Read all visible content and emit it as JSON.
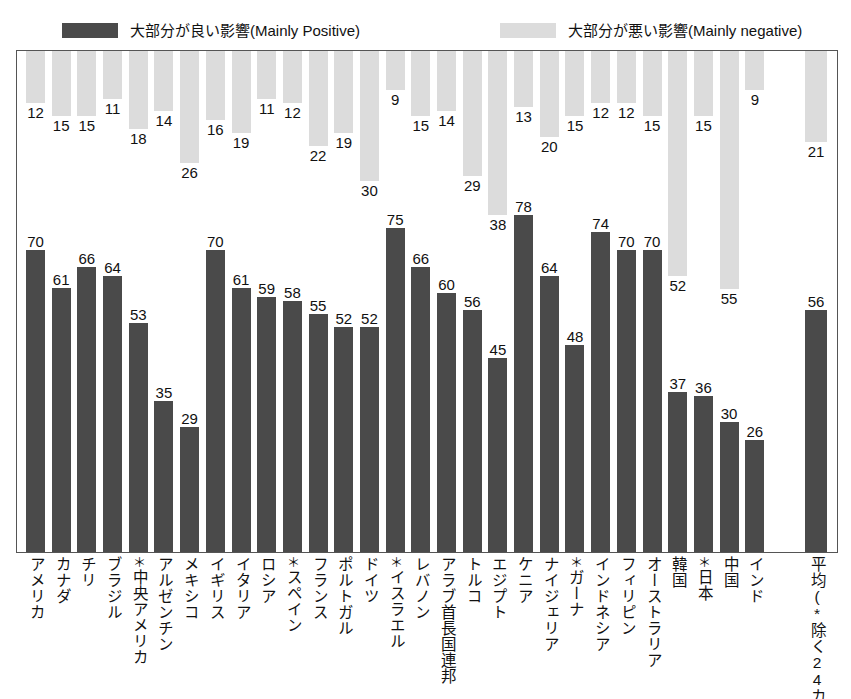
{
  "legend": {
    "positive_label": "大部分が良い影響(Mainly Positive)",
    "negative_label": "大部分が悪い影響(Mainly negative)",
    "positive_color": "#4a4a4a",
    "negative_color": "#dcdcdc"
  },
  "chart_data": {
    "type": "bar",
    "title": "",
    "xlabel": "",
    "ylabel": "",
    "ylim": [
      0,
      100
    ],
    "grid": false,
    "legend_position": "top",
    "orientation": "diverging-vertical",
    "note": "Dark bars rise from baseline (Mainly Positive); light bars hang from top (Mainly negative)",
    "categories": [
      "アメリカ",
      "カナダ",
      "チリ",
      "ブラジル",
      "*中央アメリカ",
      "アルゼンチン",
      "メキシコ",
      "イギリス",
      "イタリア",
      "ロシア",
      "*スペイン",
      "フランス",
      "ポルトガル",
      "ドイツ",
      "*イスラエル",
      "レバノン",
      "アラブ首長国連邦",
      "トルコ",
      "エジプト",
      "ケニア",
      "ナイジェリア",
      "*ガーナ",
      "インドネシア",
      "フィリピン",
      "オーストラリア",
      "韓国",
      "*日本",
      "中国",
      "インド",
      "平均(*除く24カ国)"
    ],
    "series": [
      {
        "name": "大部分が良い影響(Mainly Positive)",
        "color": "#4a4a4a",
        "values": [
          70,
          61,
          66,
          64,
          53,
          35,
          29,
          70,
          61,
          59,
          58,
          55,
          52,
          52,
          75,
          66,
          60,
          56,
          45,
          78,
          64,
          48,
          74,
          70,
          70,
          37,
          36,
          30,
          26,
          56
        ]
      },
      {
        "name": "大部分が悪い影響(Mainly negative)",
        "color": "#dcdcdc",
        "values": [
          12,
          15,
          15,
          11,
          18,
          14,
          26,
          16,
          19,
          11,
          12,
          22,
          19,
          30,
          9,
          15,
          14,
          29,
          38,
          13,
          20,
          15,
          12,
          12,
          15,
          52,
          15,
          55,
          9,
          21
        ]
      }
    ]
  }
}
